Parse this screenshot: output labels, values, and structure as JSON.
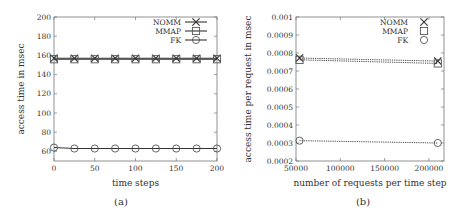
{
  "chart_data": [
    {
      "id": "a",
      "type": "line",
      "caption": "(a)",
      "title": "",
      "xlabel": "time steps",
      "ylabel": "access time in msec",
      "xlim": [
        0,
        200
      ],
      "ylim": [
        50,
        200
      ],
      "xticks": [
        0,
        50,
        100,
        150,
        200
      ],
      "yticks": [
        60,
        80,
        100,
        120,
        140,
        160,
        180,
        200
      ],
      "grid": false,
      "legend_position": "top-right",
      "x": [
        0,
        25,
        50,
        75,
        100,
        125,
        150,
        175,
        200
      ],
      "series": [
        {
          "name": "NOMM",
          "marker": "x",
          "line": "solid",
          "values": [
            157,
            157,
            157,
            157,
            157,
            157,
            157,
            157,
            157
          ]
        },
        {
          "name": "MMAP",
          "marker": "square",
          "line": "solid",
          "values": [
            156,
            156,
            156,
            156,
            156,
            156,
            156,
            156,
            156
          ]
        },
        {
          "name": "FK",
          "marker": "circle",
          "line": "solid",
          "values": [
            64,
            63,
            63,
            63,
            63,
            63,
            63,
            63,
            63
          ]
        }
      ],
      "frame": {
        "x0": 54,
        "y0": 17,
        "x1": 217,
        "y1": 161
      }
    },
    {
      "id": "b",
      "type": "line",
      "caption": "(b)",
      "title": "",
      "xlabel": "number of requests per time step",
      "ylabel": "access time per request in msec",
      "xlim": [
        50000,
        217000
      ],
      "ylim": [
        0.0002,
        0.001
      ],
      "xticks": [
        50000,
        100000,
        150000,
        200000
      ],
      "yticks": [
        0.0002,
        0.0003,
        0.0004,
        0.0005,
        0.0006,
        0.0007,
        0.0008,
        0.0009,
        0.001
      ],
      "grid": false,
      "legend_position": "top-right",
      "x": [
        54000,
        210000
      ],
      "series": [
        {
          "name": "NOMM",
          "marker": "x",
          "line": "dotted",
          "values": [
            0.000772,
            0.000755
          ]
        },
        {
          "name": "MMAP",
          "marker": "square",
          "line": "dotted",
          "values": [
            0.000762,
            0.000742
          ]
        },
        {
          "name": "FK",
          "marker": "circle",
          "line": "dotted",
          "values": [
            0.000313,
            0.0003
          ]
        }
      ],
      "frame": {
        "x0": 296,
        "y0": 17,
        "x1": 444,
        "y1": 161
      }
    }
  ],
  "colors": {
    "axis": "#777777",
    "line": "#333333",
    "text": "#333333"
  }
}
